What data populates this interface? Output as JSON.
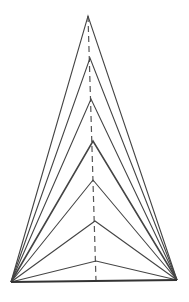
{
  "diagram": {
    "stroke_color": "#444444",
    "base": {
      "left": [
        11,
        282
      ],
      "right": [
        177,
        280
      ]
    },
    "axis": {
      "top": [
        88,
        16
      ],
      "bottom": [
        96,
        281
      ],
      "style": "dashed"
    },
    "apexes": [
      [
        88,
        16
      ],
      [
        90,
        58
      ],
      [
        91,
        99
      ],
      [
        93,
        141
      ],
      [
        93,
        180
      ],
      [
        95,
        221
      ],
      [
        96,
        261
      ]
    ]
  }
}
